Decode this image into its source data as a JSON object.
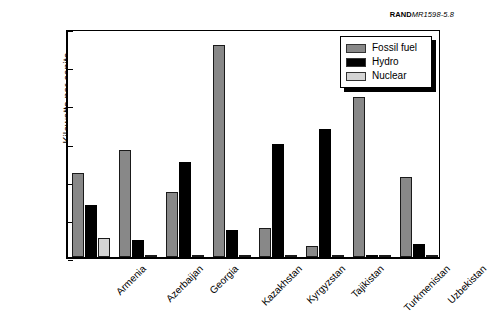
{
  "source_id": {
    "bold": "RAND",
    "italic": "MR1598-5.8"
  },
  "legend": {
    "position": "top-right",
    "items": [
      {
        "label": "Fossil fuel",
        "color": "#888888"
      },
      {
        "label": "Hydro",
        "color": "#000000"
      },
      {
        "label": "Nuclear",
        "color": "#d4d4d4"
      }
    ]
  },
  "chart_data": {
    "type": "bar",
    "title": "",
    "xlabel": "",
    "ylabel": "Kilowatts per capita",
    "ylim": [
      0,
      1.2
    ],
    "yticks": [
      "0.00",
      "0.20",
      "0.40",
      "0.60",
      "0.80",
      "1.00",
      "1.20"
    ],
    "ytick_values": [
      0,
      0.2,
      0.4,
      0.6,
      0.8,
      1.0,
      1.2
    ],
    "grid": false,
    "legend_position": "top-right",
    "categories": [
      "Armenia",
      "Azerbaijan",
      "Georgia",
      "Kazakhstan",
      "Kyrgyzstan",
      "Tajikistan",
      "Turkmenistan",
      "Uzbekistan"
    ],
    "series": [
      {
        "name": "Fossil fuel",
        "color": "#888888",
        "values": [
          0.44,
          0.56,
          0.34,
          1.11,
          0.15,
          0.06,
          0.84,
          0.42
        ]
      },
      {
        "name": "Hydro",
        "color": "#000000",
        "values": [
          0.27,
          0.09,
          0.5,
          0.14,
          0.59,
          0.67,
          0.01,
          0.07
        ]
      },
      {
        "name": "Nuclear",
        "color": "#d4d4d4",
        "values": [
          0.1,
          0.0,
          0.0,
          0.0,
          0.0,
          0.0,
          0.0,
          0.0
        ]
      }
    ]
  }
}
